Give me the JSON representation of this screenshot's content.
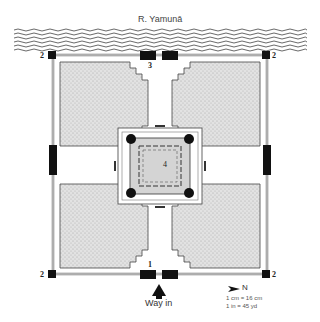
{
  "river": {
    "label": "R. Yamunā"
  },
  "labels": {
    "corner_nw": "2",
    "corner_ne": "2",
    "corner_sw": "2",
    "corner_se": "2",
    "gate_river": "3",
    "gate_entrance": "1",
    "tomb": "4",
    "way_in": "Way in",
    "north": "N",
    "scale_cm": "1 cm = 16 cm",
    "scale_in": "1 in = 45 yd"
  },
  "colors": {
    "wall": "#888888",
    "tower": "#1a1a1a",
    "garden": "#d8d8d8",
    "water": "#555555"
  }
}
